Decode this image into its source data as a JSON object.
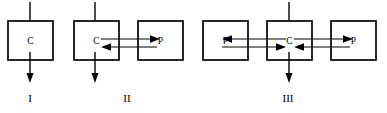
{
  "diagram": {
    "background_color": "#ffffff",
    "line_color": "#000000",
    "width": 387,
    "height": 113,
    "groups": [
      {
        "id": "group-1",
        "label": "I",
        "label_x": 30,
        "label_y": 99,
        "boxes": [
          {
            "id": "g1-box-c",
            "label": "C",
            "x": 8,
            "y": 21,
            "w": 45,
            "h": 39
          }
        ],
        "vertical_arrows": [
          {
            "id": "g1-arrow-in",
            "direction": "down-in",
            "x": 30,
            "y_start": 2,
            "y_end": 31
          },
          {
            "id": "g1-arrow-out",
            "direction": "down-out",
            "x": 30,
            "y_start": 52,
            "y_end": 82
          }
        ],
        "connectors": []
      },
      {
        "id": "group-2",
        "label": "II",
        "label_x": 127,
        "label_y": 99,
        "boxes": [
          {
            "id": "g2-box-c",
            "label": "C",
            "x": 74,
            "y": 21,
            "w": 45,
            "h": 39
          },
          {
            "id": "g2-box-p",
            "label": "P",
            "x": 138,
            "y": 21,
            "w": 45,
            "h": 39
          }
        ],
        "vertical_arrows": [
          {
            "id": "g2-arrow-in",
            "direction": "down-in",
            "x": 95,
            "y_start": 2,
            "y_end": 31
          },
          {
            "id": "g2-arrow-out",
            "direction": "down-out",
            "x": 95,
            "y_start": 52,
            "y_end": 82
          }
        ],
        "connectors": [
          {
            "id": "g2-conn-top",
            "from": "C",
            "to": "P",
            "direction": "right",
            "x_start": 101,
            "x_end": 157,
            "y": 39
          },
          {
            "id": "g2-conn-bottom",
            "from": "P",
            "to": "C",
            "direction": "left",
            "x_start": 157,
            "x_end": 101,
            "y": 47
          }
        ]
      },
      {
        "id": "group-3",
        "label": "III",
        "label_x": 288,
        "label_y": 99,
        "boxes": [
          {
            "id": "g3-box-p-left",
            "label": "P",
            "x": 203,
            "y": 21,
            "w": 45,
            "h": 39
          },
          {
            "id": "g3-box-c",
            "label": "C",
            "x": 267,
            "y": 21,
            "w": 45,
            "h": 39
          },
          {
            "id": "g3-box-p-right",
            "label": "P",
            "x": 331,
            "y": 21,
            "w": 45,
            "h": 39
          }
        ],
        "vertical_arrows": [
          {
            "id": "g3-arrow-in",
            "direction": "down-in",
            "x": 289,
            "y_start": 2,
            "y_end": 31
          },
          {
            "id": "g3-arrow-out",
            "direction": "down-out",
            "x": 289,
            "y_start": 52,
            "y_end": 82
          }
        ],
        "connectors": [
          {
            "id": "g3-conn-left-top",
            "from": "C",
            "to": "P",
            "direction": "left",
            "x_start": 286,
            "x_end": 222,
            "y": 39
          },
          {
            "id": "g3-conn-left-bottom",
            "from": "P",
            "to": "C",
            "direction": "right",
            "x_start": 222,
            "x_end": 286,
            "y": 47
          },
          {
            "id": "g3-conn-right-top",
            "from": "C",
            "to": "P",
            "direction": "right",
            "x_start": 294,
            "x_end": 350,
            "y": 39
          },
          {
            "id": "g3-conn-right-bottom",
            "from": "P",
            "to": "C",
            "direction": "left",
            "x_start": 350,
            "x_end": 294,
            "y": 47
          }
        ]
      }
    ]
  }
}
